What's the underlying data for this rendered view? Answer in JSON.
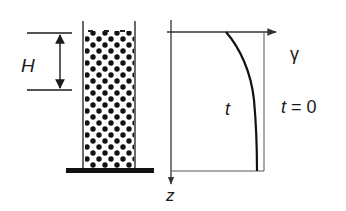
{
  "diagram": {
    "type": "physics-schematic",
    "colors": {
      "ink": "#1a1a1a",
      "thin_line": "#555555",
      "background": "#ffffff"
    },
    "column": {
      "label_height": "H",
      "fill": "packed-spheres"
    },
    "plot": {
      "horizontal_axis_label": "γ",
      "vertical_axis_label": "z",
      "curves": [
        {
          "name": "initial",
          "label": "t = 0",
          "shape": "vertical-line"
        },
        {
          "name": "later",
          "label": "t",
          "shape": "concave-curve"
        }
      ]
    }
  },
  "labels": {
    "H": "H",
    "gamma": "γ",
    "z": "z",
    "t": "t",
    "t_zero": "t = 0"
  }
}
